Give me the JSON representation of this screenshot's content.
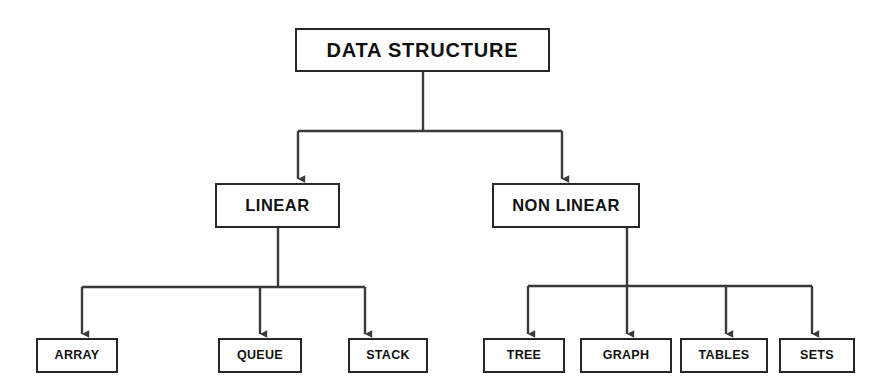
{
  "diagram": {
    "title": "DATA STRUCTURE",
    "type": "hierarchy-tree",
    "orientation": "top-down",
    "canvas": {
      "width": 891,
      "height": 392,
      "background": "#ffffff"
    },
    "style": {
      "box_border_color": "#272727",
      "box_fill_color": "#ffffff",
      "connector_color": "#3a3a3a",
      "text_color": "#111111"
    },
    "levels": [
      {
        "level": 1,
        "nodes": [
          {
            "id": "root",
            "label": "DATA STRUCTURE",
            "x": 295,
            "y": 28,
            "w": 255,
            "h": 44
          }
        ]
      },
      {
        "level": 2,
        "nodes": [
          {
            "id": "linear",
            "label": "LINEAR",
            "x": 215,
            "y": 183,
            "w": 125,
            "h": 45
          },
          {
            "id": "nonlinear",
            "label": "NON LINEAR",
            "x": 492,
            "y": 183,
            "w": 148,
            "h": 45
          }
        ]
      },
      {
        "level": 3,
        "nodes": [
          {
            "id": "array",
            "label": "ARRAY",
            "x": 36,
            "y": 338,
            "w": 82,
            "h": 35
          },
          {
            "id": "queue",
            "label": "QUEUE",
            "x": 218,
            "y": 338,
            "w": 84,
            "h": 35
          },
          {
            "id": "stack",
            "label": "STACK",
            "x": 348,
            "y": 338,
            "w": 80,
            "h": 35
          },
          {
            "id": "tree",
            "label": "TREE",
            "x": 483,
            "y": 338,
            "w": 82,
            "h": 35
          },
          {
            "id": "graph",
            "label": "GRAPH",
            "x": 580,
            "y": 338,
            "w": 92,
            "h": 35
          },
          {
            "id": "tables",
            "label": "TABLES",
            "x": 680,
            "y": 338,
            "w": 88,
            "h": 35
          },
          {
            "id": "sets",
            "label": "SETS",
            "x": 779,
            "y": 338,
            "w": 76,
            "h": 35
          }
        ]
      }
    ],
    "edges": [
      {
        "from": "root",
        "to": "linear"
      },
      {
        "from": "root",
        "to": "nonlinear"
      },
      {
        "from": "linear",
        "to": "array"
      },
      {
        "from": "linear",
        "to": "queue"
      },
      {
        "from": "linear",
        "to": "stack"
      },
      {
        "from": "nonlinear",
        "to": "tree"
      },
      {
        "from": "nonlinear",
        "to": "graph"
      },
      {
        "from": "nonlinear",
        "to": "tables"
      },
      {
        "from": "nonlinear",
        "to": "sets"
      }
    ]
  }
}
